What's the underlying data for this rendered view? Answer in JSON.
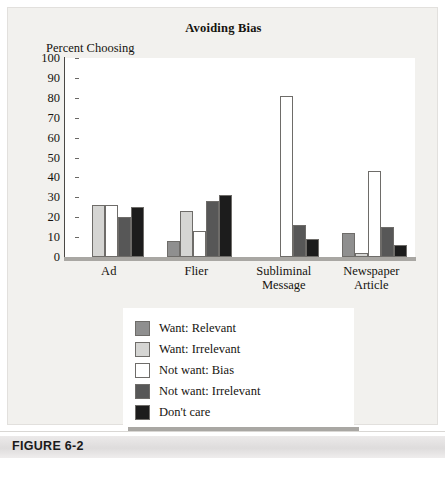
{
  "figure": {
    "caption_label": "FIGURE 6-2"
  },
  "chart_data": {
    "type": "bar",
    "title": "Avoiding Bias",
    "xlabel": "",
    "ylabel": "Percent Choosing",
    "ylim": [
      0,
      100
    ],
    "yticks": [
      0,
      10,
      20,
      30,
      40,
      50,
      60,
      70,
      80,
      90,
      100
    ],
    "ytick_labels": [
      "0",
      "10",
      "20",
      "30",
      "40",
      "50",
      "60",
      "70",
      "80",
      "90",
      "100"
    ],
    "grid": false,
    "legend_position": "below-plot",
    "categories": [
      "Ad",
      "Flier",
      "Subliminal Message",
      "Newspaper Article"
    ],
    "category_lines": [
      [
        "Ad"
      ],
      [
        "Flier"
      ],
      [
        "Subliminal",
        "Message"
      ],
      [
        "Newspaper",
        "Article"
      ]
    ],
    "series": [
      {
        "name": "Want: Relevant",
        "color": "#8f8f8f",
        "values": [
          0,
          8,
          0,
          12
        ]
      },
      {
        "name": "Want: Irrelevant",
        "color": "#d5d5d3",
        "values": [
          26,
          23,
          0,
          2
        ]
      },
      {
        "name": "Not want: Bias",
        "color": "#ffffff",
        "values": [
          26,
          13,
          81,
          43
        ]
      },
      {
        "name": "Not want: Irrelevant",
        "color": "#575757",
        "values": [
          20,
          28,
          16,
          15
        ]
      },
      {
        "name": "Don't care",
        "color": "#1c1c1c",
        "values": [
          25,
          31,
          9,
          6
        ]
      }
    ]
  }
}
